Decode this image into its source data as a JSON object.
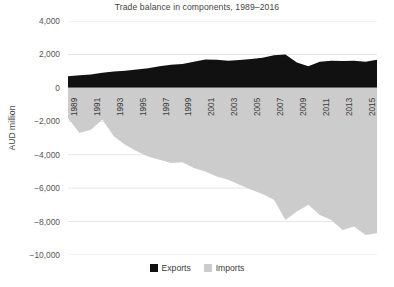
{
  "chart_data": {
    "type": "area",
    "title": "Trade balance in components, 1989–2016",
    "xlabel": "",
    "ylabel": "AUD million",
    "ylim": [
      -10000,
      4000
    ],
    "yticks": [
      "4,000",
      "2,000",
      "0",
      "−2,000",
      "−4,000",
      "−6,000",
      "−8,000",
      "−10,000"
    ],
    "ytick_values": [
      4000,
      2000,
      0,
      -2000,
      -4000,
      -6000,
      -8000,
      -10000
    ],
    "grid": true,
    "legend_position": "bottom",
    "x": [
      1989,
      1990,
      1991,
      1992,
      1993,
      1994,
      1995,
      1996,
      1997,
      1998,
      1999,
      2000,
      2001,
      2002,
      2003,
      2004,
      2005,
      2006,
      2007,
      2008,
      2009,
      2010,
      2011,
      2012,
      2013,
      2014,
      2015,
      2016
    ],
    "xtick_labels": [
      "1989",
      "1991",
      "1993",
      "1995",
      "1997",
      "1999",
      "2001",
      "2003",
      "2005",
      "2007",
      "2009",
      "2011",
      "2013",
      "2015"
    ],
    "categories": [
      "1989",
      "1990",
      "1991",
      "1992",
      "1993",
      "1994",
      "1995",
      "1996",
      "1997",
      "1998",
      "1999",
      "2000",
      "2001",
      "2002",
      "2003",
      "2004",
      "2005",
      "2006",
      "2007",
      "2008",
      "2009",
      "2010",
      "2011",
      "2012",
      "2013",
      "2014",
      "2015",
      "2016"
    ],
    "series": [
      {
        "name": "Exports",
        "color": "#111111",
        "values": [
          700,
          760,
          800,
          900,
          980,
          1020,
          1100,
          1180,
          1300,
          1380,
          1420,
          1560,
          1700,
          1680,
          1620,
          1660,
          1720,
          1800,
          1950,
          2000,
          1520,
          1300,
          1560,
          1620,
          1600,
          1620,
          1560,
          1680
        ]
      },
      {
        "name": "Imports",
        "color": "#cccccc",
        "values": [
          -1800,
          -2700,
          -2500,
          -1900,
          -2900,
          -3400,
          -3800,
          -4100,
          -4300,
          -4500,
          -4450,
          -4800,
          -5000,
          -5300,
          -5500,
          -5800,
          -6100,
          -6350,
          -6700,
          -7900,
          -7400,
          -7000,
          -7600,
          -7900,
          -8500,
          -8300,
          -8800,
          -8700
        ]
      }
    ]
  },
  "legend": {
    "items": [
      {
        "label": "Exports",
        "color": "#111111"
      },
      {
        "label": "Imports",
        "color": "#cccccc"
      }
    ]
  }
}
